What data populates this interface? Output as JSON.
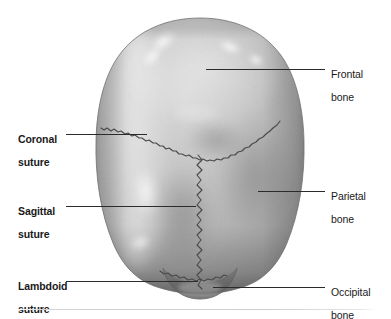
{
  "figure": {
    "title_alt": "Superior view of the skull showing cranial bones and sutures",
    "background_color": "#ffffff",
    "line_color": "#2b2b2b",
    "baseline_color": "#cfcfcf"
  },
  "labels": {
    "left": [
      {
        "id": "coronal-suture",
        "line1": "Coronal",
        "line2": "suture",
        "bold": true
      },
      {
        "id": "sagittal-suture",
        "line1": "Sagittal",
        "line2": "suture",
        "bold": true
      },
      {
        "id": "lambdoid-suture",
        "line1": "Lambdoid",
        "line2": "suture",
        "bold": true
      }
    ],
    "right": [
      {
        "id": "frontal-bone",
        "line1": "Frontal",
        "line2": "bone",
        "bold": false
      },
      {
        "id": "parietal-bone",
        "line1": "Parietal",
        "line2": "bone",
        "bold": false
      },
      {
        "id": "occipital-bone",
        "line1": "Occipital",
        "line2": "bone",
        "bold": false
      }
    ]
  },
  "anatomy": {
    "bones": [
      "Frontal bone",
      "Parietal bone",
      "Occipital bone"
    ],
    "sutures": [
      "Coronal suture",
      "Sagittal suture",
      "Lambdoid suture"
    ],
    "view": "Superior (vertex) view"
  }
}
